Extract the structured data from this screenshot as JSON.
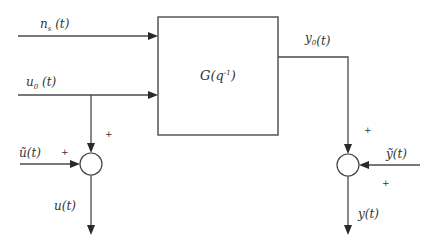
{
  "diagram": {
    "type": "block-diagram",
    "block": {
      "label_main": "G",
      "label_arg": "q",
      "label_exp": "-1",
      "label_full": "G(q^-1)"
    },
    "signals": {
      "noise_input": {
        "base": "n",
        "sub": "s",
        "arg": "(t)",
        "full": "n_s(t)"
      },
      "control_input": {
        "base": "u",
        "sub": "0",
        "arg": "(t)",
        "full": "u_0(t)"
      },
      "output": {
        "base": "y",
        "sub": "0",
        "arg": "(t)",
        "full": "y_0(t)"
      },
      "input_noise": {
        "base": "ũ",
        "arg": "(t)",
        "full": "ũ(t)"
      },
      "measured_input": {
        "base": "u",
        "arg": "(t)",
        "full": "u(t)"
      },
      "output_noise": {
        "base": "ỹ",
        "arg": "(t)",
        "full": "ỹ(t)"
      },
      "measured_output": {
        "base": "y",
        "arg": "(t)",
        "full": "y(t)"
      }
    },
    "summing_junctions": [
      {
        "name": "input-sum",
        "signs": [
          "+",
          "+"
        ]
      },
      {
        "name": "output-sum",
        "signs": [
          "+",
          "+"
        ]
      }
    ],
    "colors": {
      "line": "#4a4a4a",
      "text": "#333333",
      "background": "#ffffff"
    }
  }
}
